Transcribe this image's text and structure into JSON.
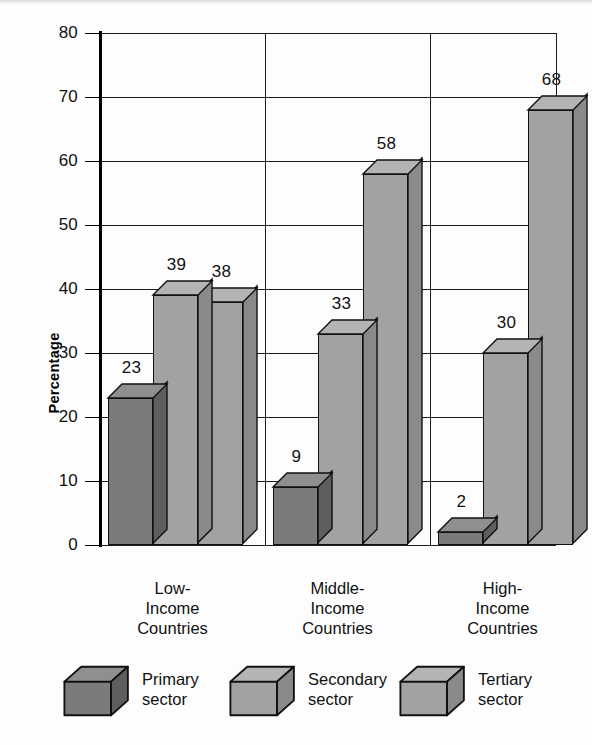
{
  "chart_data": {
    "type": "bar",
    "title": "",
    "xlabel": "",
    "ylabel": "Percentage",
    "ylim": [
      0,
      80
    ],
    "yticks": [
      0,
      10,
      20,
      30,
      40,
      50,
      60,
      70,
      80
    ],
    "grid": true,
    "legend_position": "bottom",
    "style": "3d-grouped-bars",
    "categories": [
      "Low-Income Countries",
      "Middle-Income Countries",
      "High-Income Countries"
    ],
    "category_lines": [
      [
        "Low-",
        "Income",
        "Countries"
      ],
      [
        "Middle-",
        "Income",
        "Countries"
      ],
      [
        "High-",
        "Income",
        "Countries"
      ]
    ],
    "series": [
      {
        "name": "Primary sector",
        "values": [
          23,
          39,
          38
        ]
      },
      {
        "name": "Secondary sector",
        "values": [
          9,
          33,
          58
        ]
      },
      {
        "name": "Tertiary sector",
        "values": [
          2,
          30,
          68
        ]
      }
    ],
    "groups": [
      {
        "category": "Low-Income Countries",
        "values": [
          23,
          39,
          38
        ]
      },
      {
        "category": "Middle-Income Countries",
        "values": [
          9,
          33,
          58
        ]
      },
      {
        "category": "High-Income Countries",
        "values": [
          2,
          30,
          68
        ]
      }
    ],
    "sector_names": [
      "Primary sector",
      "Secondary sector",
      "Tertiary sector"
    ],
    "data_labels": [
      "23",
      "39",
      "38",
      "9",
      "33",
      "58",
      "2",
      "30",
      "68"
    ]
  },
  "legend": {
    "items": [
      {
        "line1": "Primary",
        "line2": "sector"
      },
      {
        "line1": "Secondary",
        "line2": "sector"
      },
      {
        "line1": "Tertiary",
        "line2": "sector"
      }
    ]
  },
  "colors": {
    "primary_front": "#7b7b7b",
    "primary_top": "#8f8f8f",
    "primary_side": "#5e5e5e",
    "secondary_front": "#a2a2a2",
    "secondary_top": "#b4b4b4",
    "secondary_side": "#8a8a8a",
    "tertiary_front": "#a2a2a2",
    "tertiary_top": "#b4b4b4",
    "tertiary_side": "#8a8a8a",
    "axis": "#000000",
    "grid": "#1a1a1a",
    "background": "#fdfdfd"
  }
}
